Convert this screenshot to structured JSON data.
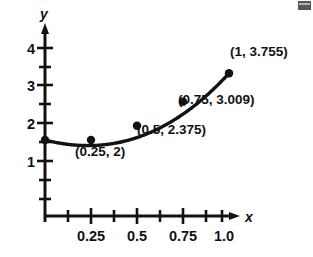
{
  "chart_data": {
    "type": "line",
    "title": "",
    "subtitle": "",
    "xlabel": "x",
    "ylabel": "y",
    "xlim": [
      0,
      1.125
    ],
    "ylim": [
      0,
      4.25
    ],
    "grid": false,
    "legend": null,
    "x_ticks_labeled": [
      {
        "value": 0.25,
        "label": "0.25"
      },
      {
        "value": 0.5,
        "label": "0.5"
      },
      {
        "value": 0.75,
        "label": "0.75"
      },
      {
        "value": 1.0,
        "label": "1.0"
      }
    ],
    "x_ticks_minor": [
      0.125,
      0.375,
      0.625,
      0.875,
      1.0625
    ],
    "y_ticks_labeled": [
      {
        "value": 1,
        "label": "1"
      },
      {
        "value": 2,
        "label": "2"
      },
      {
        "value": 3,
        "label": "3"
      },
      {
        "value": 4,
        "label": "4"
      }
    ],
    "y_ticks_minor": [
      0.5,
      1.5,
      2.5,
      3.5
    ],
    "series": [
      {
        "name": "curve",
        "x": [
          0,
          0.25,
          0.5,
          0.75,
          1
        ],
        "values": [
          2,
          2,
          2.375,
          3.009,
          3.755
        ],
        "color": "#121212"
      }
    ],
    "points": [
      {
        "x": 0,
        "y": 2,
        "label": "",
        "marked": true
      },
      {
        "x": 0.25,
        "y": 2,
        "label": "(0.25, 2)",
        "marked": true
      },
      {
        "x": 0.5,
        "y": 2.375,
        "label": "(0.5, 2.375)",
        "marked": true
      },
      {
        "x": 0.75,
        "y": 3.009,
        "label": "(0.75, 3.009)",
        "marked": true
      },
      {
        "x": 1,
        "y": 3.755,
        "label": "(1, 3.755)",
        "marked": true
      }
    ],
    "annotations": [
      {
        "text": "(0.25, 2)",
        "anchor_x": 0.25,
        "anchor_y": 2
      },
      {
        "text": "(0.5, 2.375)",
        "anchor_x": 0.5,
        "anchor_y": 2.375
      },
      {
        "text": "(0.75, 3.009)",
        "anchor_x": 0.75,
        "anchor_y": 3.009
      },
      {
        "text": "(1, 3.755)",
        "anchor_x": 1,
        "anchor_y": 3.755
      }
    ]
  },
  "axes": {
    "x_axis_label": "x",
    "y_axis_label": "y"
  },
  "labels": {
    "x_tick_0": "0.25",
    "x_tick_1": "0.5",
    "x_tick_2": "0.75",
    "x_tick_3": "1.0",
    "y_tick_0": "1",
    "y_tick_1": "2",
    "y_tick_2": "3",
    "y_tick_3": "4",
    "point_0": "(0.25, 2)",
    "point_1": "(0.5, 2.375)",
    "point_2": "(0.75, 3.009)",
    "point_3": "(1, 3.755)"
  },
  "colors": {
    "ink": "#121212",
    "background": "#ffffff"
  }
}
